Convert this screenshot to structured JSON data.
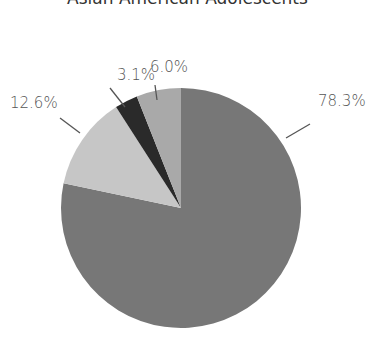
{
  "chart_data": {
    "type": "pie",
    "title": "Asian American Adolescents",
    "slices": [
      {
        "label": "78.3%",
        "value": 78.3,
        "color": "#777777"
      },
      {
        "label": "12.6%",
        "value": 12.6,
        "color": "#c6c6c6"
      },
      {
        "label": "3.1%",
        "value": 3.1,
        "color": "#2a2a2a"
      },
      {
        "label": "6.0%",
        "value": 6.0,
        "color": "#a9a9a9"
      }
    ],
    "start_angle": "12 o'clock, clockwise",
    "legend": "none",
    "labels_outside_with_leader_lines": true
  }
}
